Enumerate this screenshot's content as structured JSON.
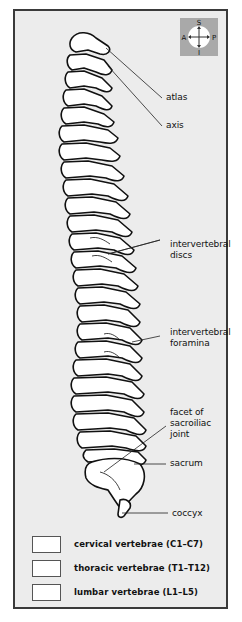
{
  "figure": {
    "view": "lateral view of vertebral column",
    "colors": {
      "background": "#ececec",
      "frame_border": "#3a3a3a",
      "bone_fill": "#ffffff",
      "outline": "#111111",
      "compass_bg": "#a9a9a9"
    }
  },
  "compass": {
    "top": "S",
    "bottom": "I",
    "left": "A",
    "right": "P"
  },
  "labels": [
    {
      "id": "atlas",
      "text": "atlas"
    },
    {
      "id": "axis",
      "text": "axis"
    },
    {
      "id": "intervertebral-discs",
      "text": "intervertebral\ndiscs"
    },
    {
      "id": "intervertebral-foramina",
      "text": "intervertebral\nforamina"
    },
    {
      "id": "facet-sacroiliac",
      "text": "facet of\nsacroiliac\njoint"
    },
    {
      "id": "sacrum",
      "text": "sacrum"
    },
    {
      "id": "coccyx",
      "text": "coccyx"
    }
  ],
  "legend": [
    {
      "label": "cervical vertebrae (C1–C7)",
      "swatch": "#ffffff"
    },
    {
      "label": "thoracic vertebrae (T1–T12)",
      "swatch": "#ffffff"
    },
    {
      "label": "lumbar vertebrae (L1–L5)",
      "swatch": "#ffffff"
    }
  ]
}
